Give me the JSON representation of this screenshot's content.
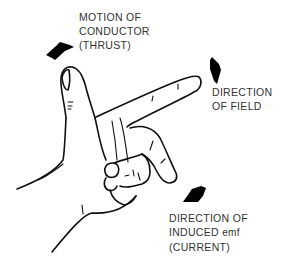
{
  "diagram": {
    "labels": {
      "thrust": {
        "line1": "MOTION OF",
        "line2": "CONDUCTOR",
        "line3": "(THRUST)"
      },
      "field": {
        "line1": "DIRECTION",
        "line2": "OF FIELD"
      },
      "current": {
        "line1": "DIRECTION OF",
        "line2_main": "INDUCED ",
        "line2_unit": "emf",
        "line3": "(CURRENT)"
      }
    },
    "arrows": [
      {
        "name": "thrust-arrow",
        "points_to": "thumb (up-left)"
      },
      {
        "name": "field-arrow",
        "points_to": "forefinger (up-right)"
      },
      {
        "name": "current-arrow",
        "points_to": "middle finger (down)"
      }
    ],
    "colors": {
      "ink": "#111111",
      "text": "#333333",
      "background": "#ffffff"
    }
  }
}
